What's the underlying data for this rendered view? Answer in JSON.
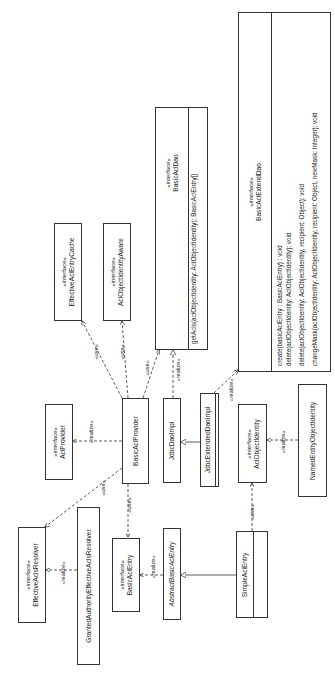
{
  "diagram": {
    "type": "UML class diagram",
    "orientation": "rotated 90° counter-clockwise",
    "stereotype_interface": "«interface»",
    "classes": [
      {
        "id": "basicAclExtendDao",
        "name": "BasicAclExtendDao",
        "interface": true,
        "operations": [
          "create(basicAclEntry : BasicAclEntry) : void",
          "delete(aclObjectIdentity: AclObjectIdentity): void",
          "delete(aclObjectIdentity: AclObjectIdentity, recipient: Object): void",
          "changeMask(aclObjectIdentity: AclObjectIdentity, recipient: Object, newMask: Integer): void"
        ]
      },
      {
        "id": "basicAclDao",
        "name": "BasicAclDao",
        "interface": true,
        "operations": [
          "getAcls(aclObjectIdentity: AclObjectIdentity): BasicAclEntry[]"
        ]
      },
      {
        "id": "effectiveAclEntryCache",
        "name": "EffectiveAclEntryCache",
        "interface": true
      },
      {
        "id": "aclObjectIdentityAware",
        "name": "AclObjectIdentityAware",
        "interface": true
      },
      {
        "id": "aclProvider",
        "name": "AclProvider",
        "interface": true
      },
      {
        "id": "basicAclProvider",
        "name": "BasicAclProvider",
        "interface": false
      },
      {
        "id": "jdbcDaoImpl",
        "name": "JdbcDaoImpl",
        "interface": false
      },
      {
        "id": "jdbcExtendedDaoImpl",
        "name": "JdbcExtendedDaoImpl",
        "interface": false
      },
      {
        "id": "aclObjectIdentity",
        "name": "AclObjectIdentity",
        "interface": true
      },
      {
        "id": "namedEntityObjectIdentity",
        "name": "NamedEntityObjectIdentity",
        "interface": false
      },
      {
        "id": "effectiveAclsResolver",
        "name": "EffectiveAclsResolver",
        "interface": true
      },
      {
        "id": "grantedAuthorityEffectiveAclsResolver",
        "name": "GrantedAuthorityEffectiveAclsResolver",
        "interface": false
      },
      {
        "id": "basicAclEntry",
        "name": "BasicAclEntry",
        "interface": true
      },
      {
        "id": "abstractBasicAclEntry",
        "name": "AbstractBasicAclEntry",
        "interface": false,
        "abstract": true
      },
      {
        "id": "simpleAclEntry",
        "name": "SimpleAclEntry",
        "interface": false
      }
    ],
    "relations": [
      {
        "from": "BasicAclProvider",
        "to": "EffectiveAclEntryCache",
        "label": "«use»",
        "kind": "dependency"
      },
      {
        "from": "BasicAclProvider",
        "to": "AclObjectIdentityAware",
        "label": "«use»",
        "kind": "dependency"
      },
      {
        "from": "BasicAclProvider",
        "to": "BasicAclDao",
        "label": "«use»",
        "kind": "dependency"
      },
      {
        "from": "JdbcDaoImpl",
        "to": "BasicAclDao",
        "label": "«realize»",
        "kind": "realization"
      },
      {
        "from": "JdbcExtendedDaoImpl",
        "to": "BasicAclExtendDao",
        "label": "«realize»",
        "kind": "realization"
      },
      {
        "from": "BasicAclProvider",
        "to": "AclProvider",
        "label": "«realize»",
        "kind": "realization"
      },
      {
        "from": "JdbcExtendedDaoImpl",
        "to": "JdbcDaoImpl",
        "label": "",
        "kind": "generalization"
      },
      {
        "from": "BasicAclProvider",
        "to": "EffectiveAclsResolver",
        "label": "«use»",
        "kind": "dependency"
      },
      {
        "from": "BasicAclProvider",
        "to": "BasicAclEntry",
        "label": "«use»",
        "kind": "dependency"
      },
      {
        "from": "GrantedAuthorityEffectiveAclsResolver",
        "to": "EffectiveAclsResolver",
        "label": "«realize»",
        "kind": "realization"
      },
      {
        "from": "AbstractBasicAclEntry",
        "to": "BasicAclEntry",
        "label": "«realize»",
        "kind": "realization"
      },
      {
        "from": "SimpleAclEntry",
        "to": "AbstractBasicAclEntry",
        "label": "",
        "kind": "generalization"
      },
      {
        "from": "SimpleAclEntry",
        "to": "AclObjectIdentity",
        "label": "«use»",
        "kind": "dependency"
      },
      {
        "from": "NamedEntityObjectIdentity",
        "to": "AclObjectIdentity",
        "label": "«realize»",
        "kind": "realization"
      }
    ],
    "labels": {
      "use": "«use»",
      "realize": "«realize»"
    }
  }
}
